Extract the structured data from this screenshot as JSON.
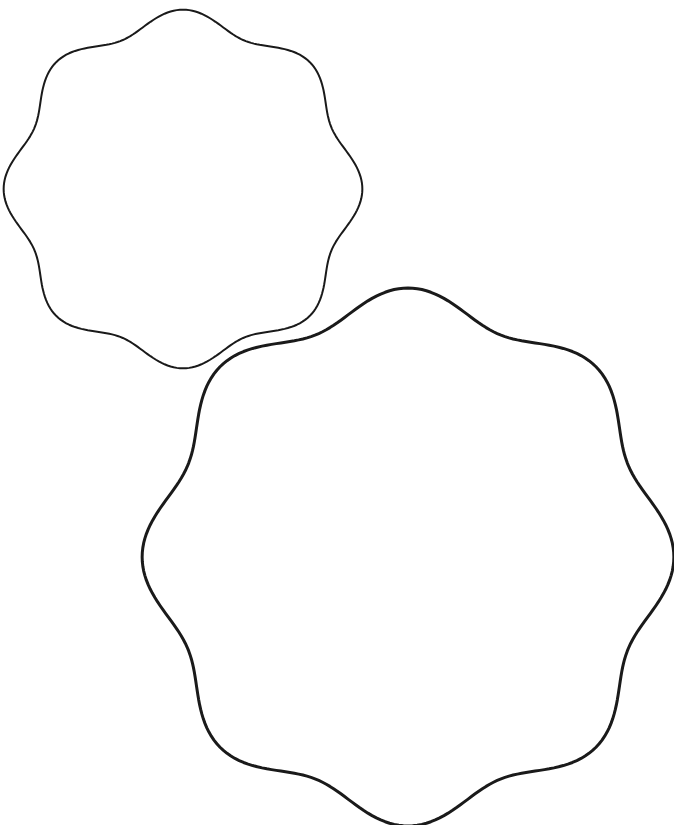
{
  "canvas": {
    "width": 674,
    "height": 825,
    "background": "#ffffff"
  },
  "shapes": [
    {
      "name": "small-wavy-octagon",
      "cx": 183,
      "cy": 189,
      "rx": 170,
      "ry": 170,
      "lobes": 8,
      "amplitude": 0.055,
      "phase_deg": -90,
      "stroke": "#1a1a1a",
      "stroke_width": 2
    },
    {
      "name": "large-wavy-octagon",
      "cx": 408,
      "cy": 557,
      "rx": 252,
      "ry": 255,
      "lobes": 8,
      "amplitude": 0.055,
      "phase_deg": -90,
      "stroke": "#1a1a1a",
      "stroke_width": 3
    }
  ]
}
